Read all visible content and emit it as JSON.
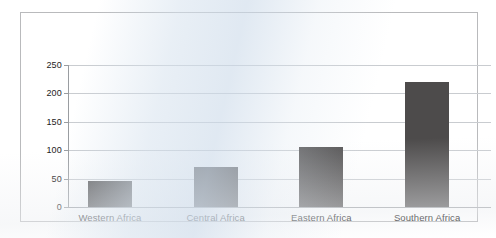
{
  "chart_data": {
    "type": "bar",
    "title": "",
    "subtitle": "",
    "xlabel": "",
    "ylabel": "",
    "categories": [
      "Western Africa",
      "Central Africa",
      "Eastern Africa",
      "Southern Africa"
    ],
    "values": [
      46,
      70,
      105,
      220
    ],
    "series": [
      {
        "name": "",
        "values": [
          46,
          70,
          105,
          220
        ]
      }
    ],
    "ylim": [
      0,
      250
    ],
    "yticks": [
      0,
      50,
      100,
      150,
      200,
      250
    ],
    "ytick_labels": [
      "0",
      "50",
      "100",
      "150",
      "200",
      "250"
    ],
    "grid": true,
    "grid_axis": "y",
    "legend": false,
    "legend_position": "none",
    "bar_color": "#4d4b4b",
    "gridline_color": "#c9ccd0",
    "axis_color": "#9a9da1",
    "frame_color": "#b9babc",
    "background_color": "#ffffff"
  },
  "figure": {
    "frame_label": "chart-frame"
  }
}
